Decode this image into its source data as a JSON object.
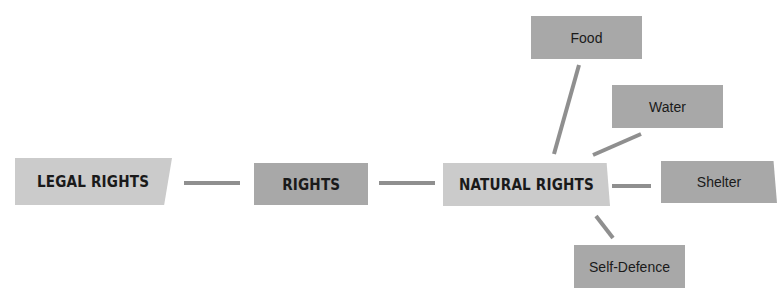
{
  "diagram": {
    "title": "",
    "nodes": [
      {
        "id": "legal",
        "label": "LEGAL RIGHTS",
        "style": "light"
      },
      {
        "id": "rights",
        "label": "RIGHTS",
        "style": "dark"
      },
      {
        "id": "natural",
        "label": "NATURAL RIGHTS",
        "style": "light"
      },
      {
        "id": "food",
        "label": "Food",
        "style": "dark"
      },
      {
        "id": "water",
        "label": "Water",
        "style": "dark"
      },
      {
        "id": "shelter",
        "label": "Shelter",
        "style": "dark"
      },
      {
        "id": "selfdefence",
        "label": "Self-Defence",
        "style": "dark"
      }
    ],
    "edges": [
      {
        "from": "legal",
        "to": "rights"
      },
      {
        "from": "rights",
        "to": "natural"
      },
      {
        "from": "natural",
        "to": "food"
      },
      {
        "from": "natural",
        "to": "water"
      },
      {
        "from": "natural",
        "to": "shelter"
      },
      {
        "from": "natural",
        "to": "selfdefence"
      }
    ],
    "colors": {
      "light_box": "#cbcbcb",
      "dark_box": "#a8a8a8",
      "connector": "#8f8f8f",
      "text": "#1a1a1a"
    }
  }
}
